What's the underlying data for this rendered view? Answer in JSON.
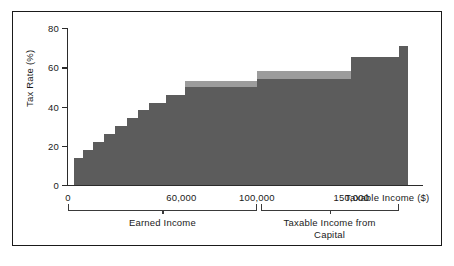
{
  "chart_data": {
    "type": "bar",
    "title": "",
    "subtitle": "",
    "xlabel": "Taxable Income ($)",
    "ylabel": "Tax Rate (%)",
    "xlim": [
      0,
      180000
    ],
    "ylim": [
      0,
      80
    ],
    "grid": false,
    "legend": "none",
    "x_ticks": [
      {
        "value": 0,
        "label": "0"
      },
      {
        "value": 60000,
        "label": "60,000"
      },
      {
        "value": 100000,
        "label": "100,000"
      },
      {
        "value": 150000,
        "label": "150,000"
      }
    ],
    "y_ticks": [
      {
        "value": 0,
        "label": "0"
      },
      {
        "value": 20,
        "label": "20"
      },
      {
        "value": 40,
        "label": "40"
      },
      {
        "value": 60,
        "label": "60"
      },
      {
        "value": 80,
        "label": "80"
      }
    ],
    "series": [
      {
        "name": "Tax Rate (dark)",
        "color": "#5c5c5c",
        "type": "step",
        "steps": [
          {
            "x0": 3000,
            "x1": 8000,
            "y": 14
          },
          {
            "x0": 8000,
            "x1": 13000,
            "y": 18
          },
          {
            "x0": 13000,
            "x1": 19000,
            "y": 22
          },
          {
            "x0": 19000,
            "x1": 25000,
            "y": 26
          },
          {
            "x0": 25000,
            "x1": 31000,
            "y": 30
          },
          {
            "x0": 31000,
            "x1": 37000,
            "y": 34
          },
          {
            "x0": 37000,
            "x1": 43000,
            "y": 38
          },
          {
            "x0": 43000,
            "x1": 52000,
            "y": 42
          },
          {
            "x0": 52000,
            "x1": 62000,
            "y": 46
          },
          {
            "x0": 62000,
            "x1": 100000,
            "y": 50
          },
          {
            "x0": 100000,
            "x1": 150000,
            "y": 54
          },
          {
            "x0": 150000,
            "x1": 175000,
            "y": 65
          },
          {
            "x0": 175000,
            "x1": 180000,
            "y": 71
          }
        ]
      },
      {
        "name": "Upper band (light)",
        "color": "#9c9c9c",
        "type": "step",
        "steps": [
          {
            "x0": 62000,
            "x1": 100000,
            "y_bottom": 50,
            "y_top": 53
          },
          {
            "x0": 100000,
            "x1": 150000,
            "y_bottom": 54,
            "y_top": 58
          }
        ]
      }
    ],
    "annotations": [
      {
        "name": "bracket-earned-income",
        "label": "Earned Income",
        "x0": 0,
        "x1": 100000
      },
      {
        "name": "bracket-capital-income",
        "label": "Taxable Income from\nCapital",
        "x0": 102000,
        "x1": 175000
      }
    ]
  },
  "axes": {
    "y_label": "Tax Rate (%)",
    "x_label": "Taxable Income ($)",
    "y_tick_labels": [
      "0",
      "20",
      "40",
      "60",
      "80"
    ],
    "x_tick_labels": [
      "0",
      "60,000",
      "100,000",
      "150,000"
    ]
  },
  "brackets": {
    "earned": {
      "label": "Earned Income"
    },
    "capital": {
      "line1": "Taxable Income from",
      "line2": "Capital"
    }
  },
  "colors": {
    "fill_dark": "#5c5c5c",
    "fill_light": "#9c9c9c",
    "axis": "#2b2b2b",
    "frame": "#1a1a1a",
    "background": "#ffffff"
  }
}
